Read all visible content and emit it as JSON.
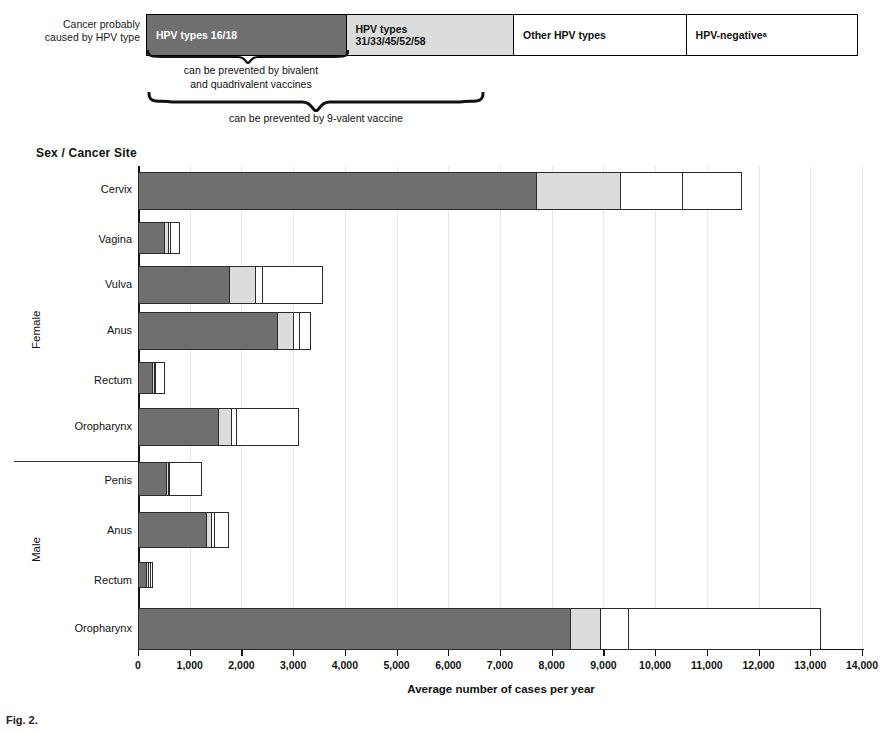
{
  "legend": {
    "caption_line1": "Cancer probably",
    "caption_line2": "caused by HPV type",
    "boxes": [
      {
        "id": "hpv-16-18",
        "label": "HPV types 16/18",
        "color": "#6f6f6f"
      },
      {
        "id": "hpv-31-33-45-52-58",
        "label": "HPV types\n31/33/45/52/58",
        "label_line1": "HPV types",
        "label_line2": "31/33/45/52/58",
        "color": "#dcdcdc"
      },
      {
        "id": "other-hpv",
        "label": "Other HPV types",
        "color": "#ffffff"
      },
      {
        "id": "hpv-negative",
        "label": "HPV-negative",
        "superscript": "a",
        "color": "#ffffff"
      }
    ],
    "brace_bivalent_line1": "can be prevented by bivalent",
    "brace_bivalent_line2": "and quadrivalent vaccines",
    "brace_9valent": "can be prevented by 9-valent vaccine"
  },
  "chart_data": {
    "type": "bar",
    "orientation": "horizontal",
    "stacked": true,
    "title": "Sex / Cancer Site",
    "xlabel": "Average number of cases per year",
    "ylabel": "Sex / Cancer Site",
    "xlim": [
      0,
      14000
    ],
    "xticks": [
      0,
      1000,
      2000,
      3000,
      4000,
      5000,
      6000,
      7000,
      8000,
      9000,
      10000,
      11000,
      12000,
      13000,
      14000
    ],
    "xticklabels": [
      "0",
      "1,000",
      "2,000",
      "3,000",
      "4,000",
      "5,000",
      "6,000",
      "7,000",
      "8,000",
      "9,000",
      "10,000",
      "11,000",
      "12,000",
      "13,000",
      "14,000"
    ],
    "grid": false,
    "legend_position": "top",
    "series": [
      {
        "name": "HPV types 16/18",
        "color": "#6f6f6f",
        "values": [
          7720,
          520,
          1780,
          2710,
          290,
          1570,
          560,
          1340,
          180,
          8370
        ]
      },
      {
        "name": "HPV types 31/33/45/52/58",
        "color": "#dcdcdc",
        "values": [
          1640,
          110,
          520,
          330,
          50,
          270,
          40,
          120,
          20,
          610
        ]
      },
      {
        "name": "Other HPV types",
        "color": "#ffffff",
        "values": [
          1220,
          40,
          160,
          150,
          30,
          130,
          30,
          80,
          10,
          560
        ]
      },
      {
        "name": "HPV-negative",
        "color": "#ffffff",
        "values": [
          1160,
          200,
          1190,
          230,
          190,
          1220,
          630,
          280,
          10,
          3730
        ]
      }
    ],
    "groups": [
      {
        "label": "Female",
        "categories": [
          "Cervix",
          "Vagina",
          "Vulva",
          "Anus",
          "Rectum",
          "Oropharynx"
        ]
      },
      {
        "label": "Male",
        "categories": [
          "Penis",
          "Anus",
          "Rectum",
          "Oropharynx"
        ]
      }
    ],
    "categories": [
      "Cervix",
      "Vagina",
      "Vulva",
      "Anus",
      "Rectum",
      "Oropharynx",
      "Penis",
      "Anus",
      "Rectum",
      "Oropharynx"
    ],
    "totals": [
      11740,
      870,
      3650,
      3420,
      560,
      3190,
      1260,
      1820,
      220,
      13270
    ]
  },
  "caption": "Fig. 2."
}
